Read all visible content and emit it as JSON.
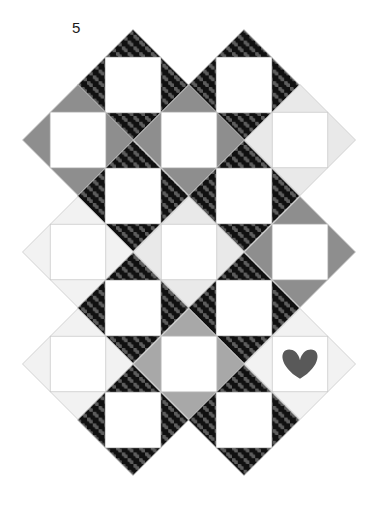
{
  "figure": {
    "label": "5",
    "canvas": {
      "width": 376,
      "height": 515,
      "background": "#ffffff"
    }
  },
  "palette": {
    "white": "#ffffff",
    "light_gray": "#e9e9e9",
    "pale_gray": "#f2f2f2",
    "medium_gray": "#8e8e8e",
    "mid_gray": "#a8a8a8",
    "dark_check_base": "#595959",
    "dark_check_dot": "#111111",
    "heart": "#595959",
    "outline": "#c9c9c9",
    "label_color": "#1a1a1a"
  },
  "geometry": {
    "block_size": 111,
    "half": 55.5,
    "origin_x": 22,
    "origin_y": 30,
    "columns": 3,
    "rows": 4,
    "center_square_ratio": 0.5,
    "note": "Blocks are set on point (rotated 45 degrees); centers are spaced one block apart horizontally and vertically."
  },
  "blocks": [
    {
      "id": "r0c0",
      "row": 0,
      "col": 0,
      "cx": 133,
      "cy": 85,
      "corners": {
        "n": "check",
        "e": "check",
        "s": "check",
        "w": "check"
      },
      "center": "white",
      "motif": "none"
    },
    {
      "id": "r0c1",
      "row": 0,
      "col": 1,
      "cx": 244,
      "cy": 85,
      "corners": {
        "n": "check",
        "e": "check",
        "s": "check",
        "w": "check"
      },
      "center": "white",
      "motif": "none"
    },
    {
      "id": "r1c0",
      "row": 1,
      "col": 0,
      "cx": 78,
      "cy": 140,
      "corners": {
        "n": "medium_gray",
        "e": "medium_gray",
        "s": "medium_gray",
        "w": "medium_gray"
      },
      "center": "white",
      "motif": "none"
    },
    {
      "id": "r1c1",
      "row": 1,
      "col": 1,
      "cx": 189,
      "cy": 140,
      "corners": {
        "n": "medium_gray",
        "e": "medium_gray",
        "s": "medium_gray",
        "w": "medium_gray"
      },
      "center": "white",
      "motif": "none"
    },
    {
      "id": "r1c2",
      "row": 1,
      "col": 2,
      "cx": 300,
      "cy": 140,
      "corners": {
        "n": "light_gray",
        "e": "light_gray",
        "s": "light_gray",
        "w": "light_gray"
      },
      "center": "white",
      "motif": "none"
    },
    {
      "id": "r2c0",
      "row": 2,
      "col": 0,
      "cx": 133,
      "cy": 196,
      "corners": {
        "n": "check",
        "e": "check",
        "s": "check",
        "w": "check"
      },
      "center": "white",
      "motif": "none"
    },
    {
      "id": "r2c1",
      "row": 2,
      "col": 1,
      "cx": 244,
      "cy": 196,
      "corners": {
        "n": "check",
        "e": "check",
        "s": "check",
        "w": "check"
      },
      "center": "white",
      "motif": "none"
    },
    {
      "id": "r3c0",
      "row": 3,
      "col": 0,
      "cx": 78,
      "cy": 252,
      "corners": {
        "n": "pale_gray",
        "e": "pale_gray",
        "s": "pale_gray",
        "w": "pale_gray"
      },
      "center": "white",
      "motif": "none"
    },
    {
      "id": "r3c1",
      "row": 3,
      "col": 1,
      "cx": 189,
      "cy": 252,
      "corners": {
        "n": "light_gray",
        "e": "light_gray",
        "s": "light_gray",
        "w": "light_gray"
      },
      "center": "white",
      "motif": "none"
    },
    {
      "id": "r3c2",
      "row": 3,
      "col": 2,
      "cx": 300,
      "cy": 252,
      "corners": {
        "n": "medium_gray",
        "e": "medium_gray",
        "s": "medium_gray",
        "w": "medium_gray"
      },
      "center": "white",
      "motif": "none"
    },
    {
      "id": "r4c0",
      "row": 4,
      "col": 0,
      "cx": 133,
      "cy": 308,
      "corners": {
        "n": "check",
        "e": "check",
        "s": "check",
        "w": "check"
      },
      "center": "white",
      "motif": "none"
    },
    {
      "id": "r4c1",
      "row": 4,
      "col": 1,
      "cx": 244,
      "cy": 308,
      "corners": {
        "n": "check",
        "e": "check",
        "s": "check",
        "w": "check"
      },
      "center": "white",
      "motif": "none"
    },
    {
      "id": "r5c0",
      "row": 5,
      "col": 0,
      "cx": 78,
      "cy": 364,
      "corners": {
        "n": "pale_gray",
        "e": "pale_gray",
        "s": "pale_gray",
        "w": "pale_gray"
      },
      "center": "white",
      "motif": "none"
    },
    {
      "id": "r5c1",
      "row": 5,
      "col": 1,
      "cx": 189,
      "cy": 364,
      "corners": {
        "n": "mid_gray",
        "e": "mid_gray",
        "s": "mid_gray",
        "w": "mid_gray"
      },
      "center": "white",
      "motif": "none"
    },
    {
      "id": "r5c2",
      "row": 5,
      "col": 2,
      "cx": 300,
      "cy": 364,
      "corners": {
        "n": "pale_gray",
        "e": "pale_gray",
        "s": "pale_gray",
        "w": "pale_gray"
      },
      "center": "white",
      "motif": "heart"
    },
    {
      "id": "r6c0",
      "row": 6,
      "col": 0,
      "cx": 133,
      "cy": 420,
      "corners": {
        "n": "check",
        "e": "check",
        "s": "check",
        "w": "check"
      },
      "center": "white",
      "motif": "none"
    },
    {
      "id": "r6c1",
      "row": 6,
      "col": 1,
      "cx": 244,
      "cy": 420,
      "corners": {
        "n": "check",
        "e": "check",
        "s": "check",
        "w": "check"
      },
      "center": "white",
      "motif": "none"
    }
  ],
  "motifs": {
    "heart": {
      "name": "heart-motif",
      "block": "r5c2",
      "cx": 300,
      "cy": 364,
      "width": 38,
      "height": 32,
      "color": "#595959"
    }
  }
}
